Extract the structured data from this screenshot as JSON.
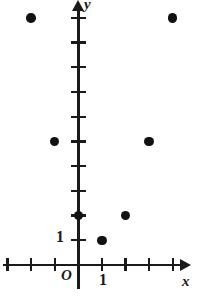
{
  "figure": {
    "axes": {
      "x_axis_label": "x",
      "y_axis_label": "y",
      "origin_label": "O",
      "x_unit_label": "1",
      "y_unit_label": "1"
    },
    "colors": {
      "ink": "#1a1a1a",
      "point_fill": "#111111",
      "background": "#ffffff"
    }
  },
  "chart_data": {
    "type": "scatter",
    "title": "",
    "xlabel": "x",
    "ylabel": "y",
    "grid": false,
    "legend": null,
    "xlim": [
      -3,
      4.3
    ],
    "ylim": [
      -0.4,
      11.1
    ],
    "x_ticks": [
      -3,
      -2,
      -1,
      0,
      1,
      2,
      3,
      4
    ],
    "y_ticks": [
      1,
      2,
      3,
      4,
      5,
      6,
      7,
      8,
      9,
      10
    ],
    "labeled_ticks": {
      "x": [
        1
      ],
      "y": [
        1
      ]
    },
    "points": [
      {
        "x": -2,
        "y": 10
      },
      {
        "x": -1,
        "y": 5
      },
      {
        "x": 0,
        "y": 2
      },
      {
        "x": 1,
        "y": 1
      },
      {
        "x": 2,
        "y": 2
      },
      {
        "x": 3,
        "y": 5
      },
      {
        "x": 4,
        "y": 10
      }
    ],
    "x_values": [
      -2,
      -1,
      0,
      1,
      2,
      3,
      4
    ],
    "y_values": [
      10,
      5,
      2,
      1,
      2,
      5,
      10
    ]
  },
  "pixel_geometry": {
    "origin": {
      "x": 78.3,
      "y": 264.9
    },
    "unit_px": {
      "x": 23.6,
      "y": 24.7
    },
    "x_tick_positions": [
      -3,
      -2,
      -1,
      1,
      2,
      3,
      4
    ],
    "y_tick_positions": [
      1,
      2,
      3,
      4,
      5,
      6,
      7,
      8,
      9,
      10
    ]
  }
}
